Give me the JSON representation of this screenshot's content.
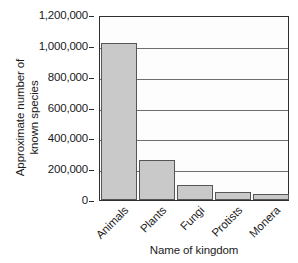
{
  "chart_data": {
    "type": "bar",
    "title": "",
    "xlabel": "Name of kingdom",
    "ylabel_line1": "Approximate number of",
    "ylabel_line2": "known species",
    "categories": [
      "Animals",
      "Plants",
      "Fungi",
      "Protists",
      "Monera"
    ],
    "values": [
      1020000,
      258000,
      100000,
      53000,
      40000
    ],
    "ylim": [
      0,
      1200000
    ],
    "ytick_values": [
      0,
      200000,
      400000,
      600000,
      800000,
      1000000,
      1200000
    ],
    "ytick_labels": [
      "0",
      "200,000",
      "400,000",
      "600,000",
      "800,000",
      "1,000,000",
      "1,200,000"
    ],
    "grid": "horizontal",
    "legend": "none",
    "bar_fill_color": "#c9c9c9",
    "bar_edge_color": "#565656",
    "axis_color": "#2f2f2f",
    "gridline_color": "#6e6e6e",
    "xtick_rotation": -45
  }
}
